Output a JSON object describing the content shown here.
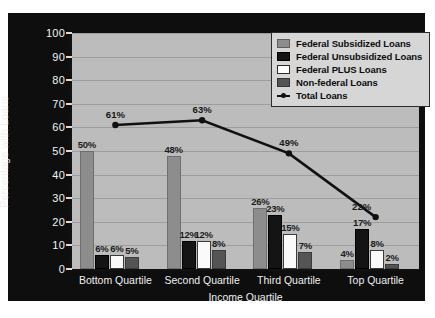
{
  "chart_data": {
    "type": "bar",
    "title": "",
    "xlabel": "Income Quartile",
    "ylabel": "Percentage with Loans",
    "ylim": [
      0,
      100
    ],
    "yticks": [
      0,
      10,
      20,
      30,
      40,
      50,
      60,
      70,
      80,
      90,
      100
    ],
    "ytick_labels": [
      "0",
      "10",
      "20",
      "30",
      "40",
      "50",
      "60",
      "70",
      "80",
      "90",
      "100"
    ],
    "grid": true,
    "legend_position": "top-right",
    "categories": [
      "Bottom Quartile",
      "Second Quartile",
      "Third Quartile",
      "Top Quartile"
    ],
    "series": [
      {
        "name": "Federal Subsidized Loans",
        "type": "bar",
        "color": "#8d8d8d",
        "values": [
          50,
          48,
          26,
          4
        ],
        "labels": [
          "50%",
          "48%",
          "26%",
          "4%"
        ]
      },
      {
        "name": "Federal Unsubsidized Loans",
        "type": "bar",
        "color": "#141414",
        "values": [
          6,
          12,
          23,
          17
        ],
        "labels": [
          "6%",
          "12%",
          "23%",
          "17%"
        ]
      },
      {
        "name": "Federal PLUS Loans",
        "type": "bar",
        "color": "#fafafa",
        "values": [
          6,
          12,
          15,
          8
        ],
        "labels": [
          "6%",
          "12%",
          "15%",
          "8%"
        ]
      },
      {
        "name": "Non-federal Loans",
        "type": "bar",
        "color": "#545454",
        "values": [
          5,
          8,
          7,
          2
        ],
        "labels": [
          "5%",
          "8%",
          "7%",
          "2%"
        ]
      },
      {
        "name": "Total Loans",
        "type": "line",
        "color": "#111111",
        "values": [
          61,
          63,
          49,
          22
        ],
        "labels": [
          "61%",
          "63%",
          "49%",
          "22%"
        ]
      }
    ]
  },
  "legend": {
    "items": [
      {
        "label": "Federal Subsidized Loans",
        "swatch": "swatch-federal-subsidized"
      },
      {
        "label": "Federal Unsubsidized Loans",
        "swatch": "swatch-federal-unsubsidized"
      },
      {
        "label": "Federal PLUS Loans",
        "swatch": "swatch-federal-plus"
      },
      {
        "label": "Non-federal Loans",
        "swatch": "swatch-non-federal"
      },
      {
        "label": "Total Loans",
        "swatch": "line-marker-icon"
      }
    ]
  }
}
